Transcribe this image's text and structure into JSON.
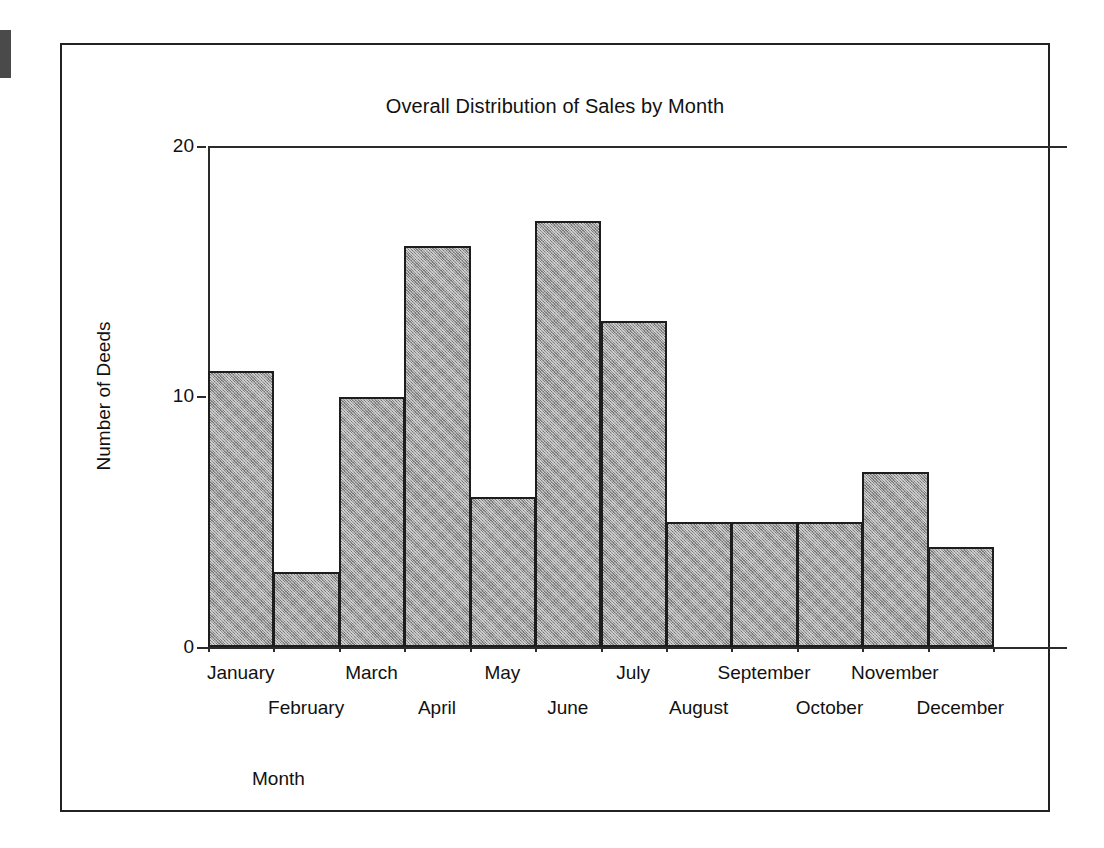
{
  "chart_data": {
    "type": "bar",
    "title": "Overall Distribution of Sales by Month",
    "xlabel": "Month",
    "ylabel": "Number of Deeds",
    "categories": [
      "January",
      "February",
      "March",
      "April",
      "May",
      "June",
      "July",
      "August",
      "September",
      "October",
      "November",
      "December"
    ],
    "values": [
      11,
      3,
      10,
      16,
      6,
      17,
      13,
      5,
      5,
      5,
      7,
      4
    ],
    "ylim": [
      0,
      20
    ],
    "yticks": [
      0,
      10,
      20
    ],
    "ytick_labels": [
      "0",
      "10",
      "20"
    ],
    "grid": false,
    "legend": null,
    "bar_style": {
      "fill": "#9a9a9a",
      "pattern": "halftone-gray",
      "border": "#1d1d1d",
      "contiguous": true
    }
  },
  "figure": {
    "frame_border_color": "#222222",
    "background": "#ffffff",
    "artifact": "scan-edge-mark"
  }
}
